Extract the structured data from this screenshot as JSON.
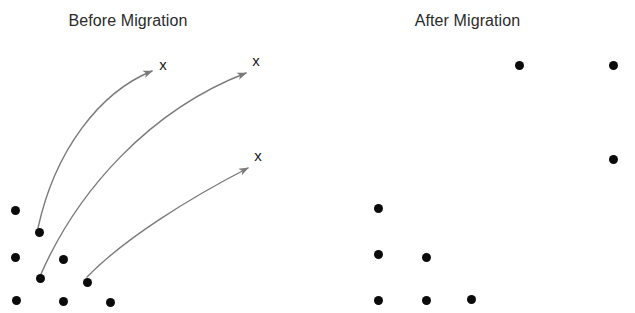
{
  "figure": {
    "background_color": "#ffffff",
    "width": 635,
    "height": 313,
    "dot_color": "#0b0b0b",
    "arrow_color": "#7a7a7a",
    "title_color": "#2b2b2b",
    "xmark_color": "#1a1a1a"
  },
  "panels": {
    "before": {
      "title": "Before Migration",
      "dots": [
        {
          "x": 15,
          "y": 210
        },
        {
          "x": 39,
          "y": 232
        },
        {
          "x": 15,
          "y": 257
        },
        {
          "x": 63,
          "y": 259
        },
        {
          "x": 40,
          "y": 278
        },
        {
          "x": 87,
          "y": 282
        },
        {
          "x": 16,
          "y": 300
        },
        {
          "x": 63,
          "y": 301
        },
        {
          "x": 110,
          "y": 302
        }
      ],
      "targets": [
        {
          "label": "x",
          "x": 163,
          "y": 64
        },
        {
          "label": "x",
          "x": 256,
          "y": 60
        },
        {
          "label": "x",
          "x": 258,
          "y": 155
        }
      ],
      "arrows": [
        {
          "from_x": 38,
          "from_y": 228,
          "c1_x": 55,
          "c1_y": 150,
          "c2_x": 100,
          "c2_y": 92,
          "to_x": 152,
          "to_y": 71
        },
        {
          "from_x": 41,
          "from_y": 274,
          "c1_x": 78,
          "c1_y": 190,
          "c2_x": 150,
          "c2_y": 110,
          "to_x": 246,
          "to_y": 73
        },
        {
          "from_x": 87,
          "from_y": 277,
          "c1_x": 125,
          "c1_y": 238,
          "c2_x": 190,
          "c2_y": 198,
          "to_x": 248,
          "to_y": 168
        }
      ]
    },
    "after": {
      "title": "After Migration",
      "dots": [
        {
          "x": 519,
          "y": 65
        },
        {
          "x": 613,
          "y": 65
        },
        {
          "x": 613,
          "y": 159
        },
        {
          "x": 378,
          "y": 208
        },
        {
          "x": 378,
          "y": 254
        },
        {
          "x": 426,
          "y": 257
        },
        {
          "x": 378,
          "y": 300
        },
        {
          "x": 426,
          "y": 300
        },
        {
          "x": 471,
          "y": 299
        }
      ]
    }
  },
  "chart_data": {
    "type": "scatter",
    "title": "",
    "xlabel": "",
    "ylabel": "",
    "grid": false,
    "legend": "none",
    "note": "Two-panel scatter diagram illustrating data point migration. Left panel shows a dense lower-left cluster of 9 points with 3 curved arrows pointing to 3 'x' target markers in the upper right. Right panel shows the same 9 points redistributed after migration.",
    "series": [
      {
        "name": "Before Migration - points",
        "marker": "filled-circle",
        "color": "#0b0b0b",
        "points": [
          [
            15,
            210
          ],
          [
            39,
            232
          ],
          [
            15,
            257
          ],
          [
            63,
            259
          ],
          [
            40,
            278
          ],
          [
            87,
            282
          ],
          [
            16,
            300
          ],
          [
            63,
            301
          ],
          [
            110,
            302
          ]
        ]
      },
      {
        "name": "Before Migration - targets",
        "marker": "x",
        "color": "#1a1a1a",
        "points": [
          [
            163,
            64
          ],
          [
            256,
            60
          ],
          [
            258,
            155
          ]
        ]
      },
      {
        "name": "After Migration - points",
        "marker": "filled-circle",
        "color": "#0b0b0b",
        "points": [
          [
            519,
            65
          ],
          [
            613,
            65
          ],
          [
            613,
            159
          ],
          [
            378,
            208
          ],
          [
            378,
            254
          ],
          [
            426,
            257
          ],
          [
            378,
            300
          ],
          [
            426,
            300
          ],
          [
            471,
            299
          ]
        ]
      }
    ],
    "annotations": [
      {
        "type": "curved-arrow",
        "from": [
          38,
          228
        ],
        "to": [
          152,
          71
        ],
        "color": "#7a7a7a"
      },
      {
        "type": "curved-arrow",
        "from": [
          41,
          274
        ],
        "to": [
          246,
          73
        ],
        "color": "#7a7a7a"
      },
      {
        "type": "curved-arrow",
        "from": [
          87,
          277
        ],
        "to": [
          248,
          168
        ],
        "color": "#7a7a7a"
      }
    ]
  }
}
